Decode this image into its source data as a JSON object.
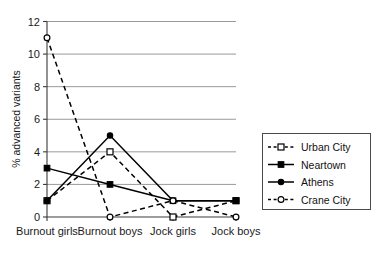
{
  "chart_data": {
    "type": "line",
    "title": "",
    "xlabel": "",
    "ylabel": "% advanced variants",
    "categories": [
      "Burnout girls",
      "Burnout boys",
      "Jock girls",
      "Jock boys"
    ],
    "ylim": [
      0,
      12
    ],
    "yticks": [
      0,
      2,
      4,
      6,
      8,
      10,
      12
    ],
    "grid": true,
    "legend_position": "right",
    "series": [
      {
        "name": "Urban City",
        "values": [
          1,
          4,
          0,
          1
        ],
        "line_style": "dashed",
        "marker": "open-square",
        "color": "#000000"
      },
      {
        "name": "Neartown",
        "values": [
          3,
          2,
          1,
          1
        ],
        "line_style": "solid",
        "marker": "filled-square",
        "color": "#000000"
      },
      {
        "name": "Athens",
        "values": [
          1,
          5,
          1,
          1
        ],
        "line_style": "solid",
        "marker": "filled-circle",
        "color": "#000000"
      },
      {
        "name": "Crane City",
        "values": [
          11,
          0,
          1,
          0
        ],
        "line_style": "dashed",
        "marker": "open-circle",
        "color": "#000000"
      }
    ]
  },
  "axis": {
    "ytick_labels": [
      "0",
      "2",
      "4",
      "6",
      "8",
      "10",
      "12"
    ],
    "y_axis_title": "% advanced variants"
  },
  "categories_labels": [
    "Burnout girls",
    "Burnout boys",
    "Jock girls",
    "Jock boys"
  ],
  "legend": {
    "entries": [
      "Urban City",
      "Neartown",
      "Athens",
      "Crane City"
    ]
  },
  "colors": {
    "ink": "#000000",
    "grid": "#9a9a9a",
    "axis": "#3a3a3a",
    "background": "#ffffff"
  }
}
